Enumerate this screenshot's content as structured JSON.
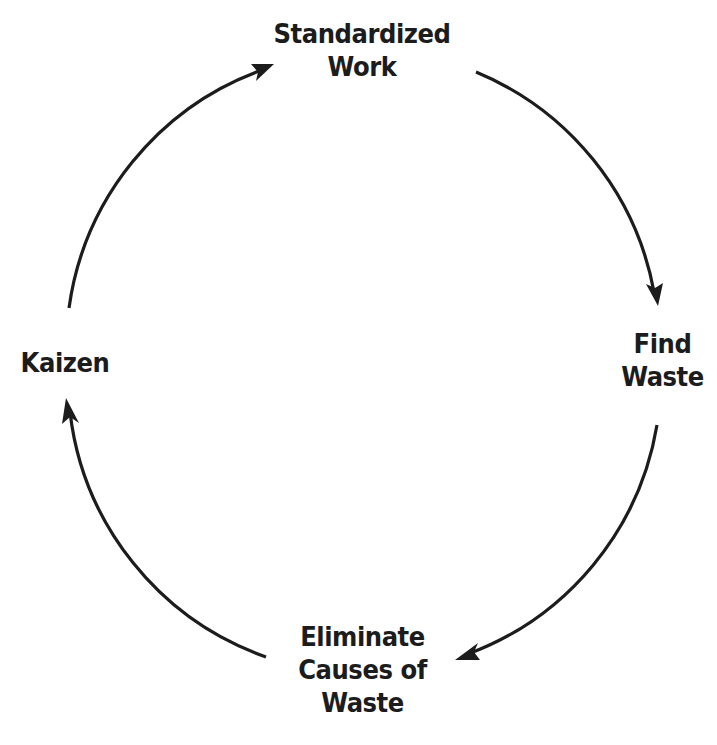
{
  "diagram": {
    "type": "cycle",
    "colors": {
      "background": "#ffffff",
      "stroke": "#1c1c1c",
      "text": "#1c1c1c"
    },
    "nodes": [
      {
        "id": "standardized-work",
        "lines": [
          "Standardized",
          "Work"
        ]
      },
      {
        "id": "find-waste",
        "lines": [
          "Find",
          "Waste"
        ]
      },
      {
        "id": "eliminate-causes",
        "lines": [
          "Eliminate",
          "Causes of",
          "Waste"
        ]
      },
      {
        "id": "kaizen",
        "lines": [
          "Kaizen"
        ]
      }
    ],
    "edges": [
      {
        "from": "standardized-work",
        "to": "find-waste"
      },
      {
        "from": "find-waste",
        "to": "eliminate-causes"
      },
      {
        "from": "eliminate-causes",
        "to": "kaizen"
      },
      {
        "from": "kaizen",
        "to": "standardized-work"
      }
    ]
  }
}
